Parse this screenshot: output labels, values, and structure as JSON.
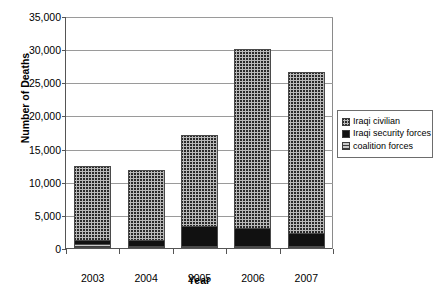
{
  "chart_data": {
    "type": "bar",
    "title": "",
    "xlabel": "Year",
    "ylabel": "Number of Deaths",
    "categories": [
      "2003",
      "2004",
      "2005",
      "2006",
      "2007"
    ],
    "ylim": [
      0,
      35000
    ],
    "ytick_labels": [
      "0",
      "5,000",
      "10,000",
      "15,000",
      "20,000",
      "25,000",
      "30,000",
      "35,000"
    ],
    "ytick_values": [
      0,
      5000,
      10000,
      15000,
      20000,
      25000,
      30000,
      35000
    ],
    "grid": true,
    "stacked": true,
    "legend_position": "right",
    "series": [
      {
        "name": "coalition forces",
        "pattern": "horizontal-hatch",
        "color": "#c9c9c9",
        "values": [
          580,
          370,
          370,
          370,
          330
        ]
      },
      {
        "name": "Iraqi security forces",
        "pattern": "solid-black",
        "color": "#111111",
        "values": [
          620,
          800,
          2900,
          2700,
          2000
        ]
      },
      {
        "name": "Iraqi civilian",
        "pattern": "crosshatch",
        "color": "#b9b9b9",
        "values": [
          11200,
          10530,
          13730,
          26930,
          24170
        ]
      }
    ],
    "totals": [
      12400,
      11700,
      17000,
      30000,
      26500
    ]
  },
  "legend": {
    "items": [
      {
        "label": "Iraqi civilian",
        "swatch": "crosshatch-swatch"
      },
      {
        "label": "Iraqi security forces",
        "swatch": "solid-black-swatch"
      },
      {
        "label": "coalition forces",
        "swatch": "horizontal-hatch-swatch"
      }
    ]
  }
}
